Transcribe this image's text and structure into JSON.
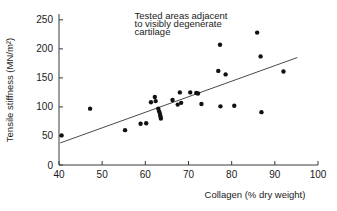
{
  "chart_data": {
    "type": "scatter",
    "title": "",
    "xlabel": "Collagen (% dry weight)",
    "ylabel": "Tensile stiffness (MN/m²)",
    "xlim": [
      40,
      100
    ],
    "ylim": [
      0,
      260
    ],
    "xticks": [
      40,
      50,
      60,
      70,
      80,
      90,
      100
    ],
    "xtick_labels": [
      "40",
      "50",
      "60",
      "70",
      "80",
      "90",
      "100"
    ],
    "yticks": [
      0,
      50,
      100,
      150,
      200,
      250
    ],
    "ytick_labels": [
      "0",
      "50",
      "100",
      "150",
      "200",
      "250"
    ],
    "grid": false,
    "legend": null,
    "annotations": [
      {
        "text": "Tested areas adjacent",
        "x": 57.5,
        "y": 252
      },
      {
        "text": "to visibly degenerate",
        "x": 57.5,
        "y": 238
      },
      {
        "text": "cartilage",
        "x": 57.5,
        "y": 224
      }
    ],
    "annotation_text": "Tested areas adjacent to visibly degenerate cartilage",
    "series": [
      {
        "name": "Tested areas adjacent to visibly degenerate cartilage",
        "marker": "filled-circle",
        "color": "#111111",
        "points": [
          [
            40.6,
            51
          ],
          [
            47.2,
            97
          ],
          [
            55.3,
            60
          ],
          [
            58.9,
            71
          ],
          [
            60.2,
            72
          ],
          [
            61.3,
            108
          ],
          [
            62.2,
            117
          ],
          [
            62.4,
            110
          ],
          [
            63.0,
            97
          ],
          [
            63.2,
            92
          ],
          [
            63.4,
            88
          ],
          [
            63.5,
            84
          ],
          [
            63.6,
            80
          ],
          [
            66.3,
            112
          ],
          [
            67.5,
            104
          ],
          [
            68.0,
            125
          ],
          [
            68.3,
            107
          ],
          [
            70.4,
            125
          ],
          [
            71.8,
            124
          ],
          [
            72.2,
            123
          ],
          [
            73.0,
            105
          ],
          [
            76.9,
            162
          ],
          [
            77.3,
            207
          ],
          [
            77.4,
            101
          ],
          [
            78.6,
            156
          ],
          [
            80.6,
            102
          ],
          [
            85.9,
            228
          ],
          [
            86.7,
            187
          ],
          [
            86.9,
            91
          ],
          [
            92.0,
            161
          ]
        ]
      }
    ],
    "fit_line": {
      "name": "regression line",
      "color": "#4a4a4a",
      "x_start": 40.3,
      "y_start": 38,
      "x_end": 95.2,
      "y_end": 185
    }
  },
  "axis": {
    "y_title": "Tensile stiffness (MN/m²)",
    "x_title": "Collagen (% dry weight)"
  }
}
